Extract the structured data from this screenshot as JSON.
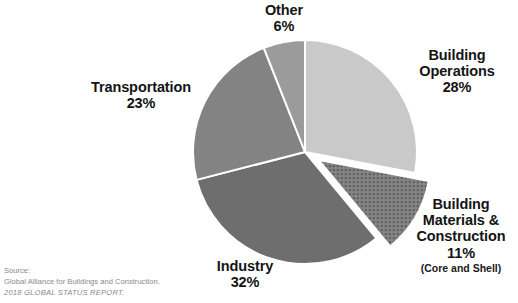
{
  "chart_data": {
    "type": "pie",
    "title": "",
    "subtitle": "",
    "xlabel": "",
    "ylabel": "",
    "legend_position": "labels-around-slices",
    "grid": false,
    "start_angle_deg": 0,
    "direction": "clockwise",
    "categories": [
      "Building Operations",
      "Building Materials & Construction",
      "Industry",
      "Transportation",
      "Other"
    ],
    "values": [
      28,
      11,
      32,
      23,
      6
    ],
    "units": "%",
    "slices": [
      {
        "name": "Building Operations",
        "label_line1": "Building",
        "label_line2": "Operations",
        "value_label": "28%",
        "value": 28,
        "color": "#c9c9c9",
        "pattern": "solid",
        "exploded": false
      },
      {
        "name": "Building Materials & Construction",
        "label_line1": "Building",
        "label_line2": "Materials &",
        "label_line3": "Construction",
        "value_label": "11%",
        "value": 11,
        "note": "(Core and Shell)",
        "color": "#8d8d8d",
        "pattern": "crosshatch-dots",
        "exploded": true
      },
      {
        "name": "Industry",
        "label_line1": "Industry",
        "value_label": "32%",
        "value": 32,
        "color": "#6e6e6e",
        "pattern": "solid",
        "exploded": false
      },
      {
        "name": "Transportation",
        "label_line1": "Transportation",
        "value_label": "23%",
        "value": 23,
        "color": "#838383",
        "pattern": "solid",
        "exploded": false
      },
      {
        "name": "Other",
        "label_line1": "Other",
        "value_label": "6%",
        "value": 6,
        "color": "#9b9b9b",
        "pattern": "solid",
        "exploded": false
      }
    ]
  },
  "labels": {
    "building_operations": {
      "line1": "Building",
      "line2": "Operations",
      "value": "28%"
    },
    "building_materials": {
      "line1": "Building",
      "line2": "Materials &",
      "line3": "Construction",
      "value": "11%",
      "note": "(Core and Shell)"
    },
    "industry": {
      "line1": "Industry",
      "value": "32%"
    },
    "transportation": {
      "line1": "Transportation",
      "value": "23%"
    },
    "other": {
      "line1": "Other",
      "value": "6%"
    }
  },
  "source": {
    "line1": "Source:",
    "line2": "Global Alliance for Buildings and Construction.",
    "line3": "2018 GLOBAL STATUS REPORT."
  }
}
